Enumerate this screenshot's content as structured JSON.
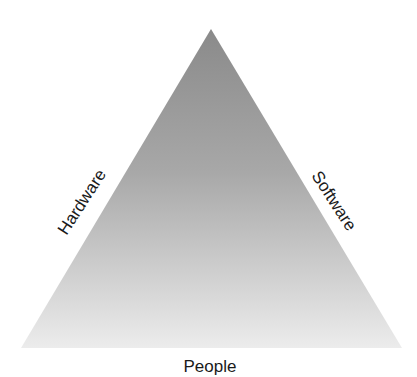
{
  "diagram": {
    "type": "triangle",
    "colors": {
      "fill_top": "#8c8c8c",
      "fill_bottom": "#ebebeb",
      "text": "#1a1a1a",
      "background": "#ffffff"
    },
    "labels": {
      "left_edge": "Hardware",
      "right_edge": "Software",
      "base": "People"
    }
  }
}
